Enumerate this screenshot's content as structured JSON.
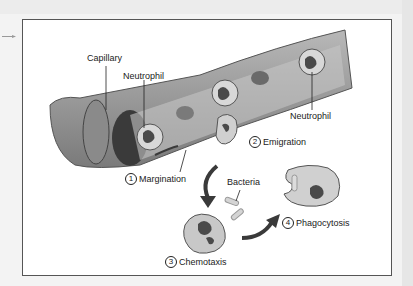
{
  "figure": {
    "type": "illustration",
    "labels": {
      "capillary": "Capillary",
      "neutrophil_left": "Neutrophil",
      "neutrophil_right": "Neutrophil",
      "bacteria": "Bacteria"
    },
    "steps": [
      {
        "number": "1",
        "label": "Margination"
      },
      {
        "number": "2",
        "label": "Emigration"
      },
      {
        "number": "3",
        "label": "Chemotaxis"
      },
      {
        "number": "4",
        "label": "Phagocytosis"
      }
    ]
  },
  "colors": {
    "vessel": "#9a9a9a",
    "vessel_dark": "#5a5a5a",
    "cell": "#c9c9c9",
    "nucleus": "#4a4a4a",
    "arrow": "#3a3a3a",
    "frame": "#555555"
  }
}
